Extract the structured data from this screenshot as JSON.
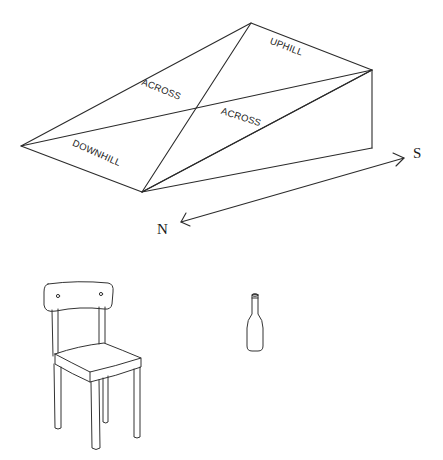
{
  "figure": {
    "type": "line-drawing"
  },
  "wedge": {
    "vertices": {
      "top": [
        251,
        23
      ],
      "right_top": [
        372,
        70
      ],
      "right_bottom": [
        372,
        148
      ],
      "bottom": [
        142,
        192
      ],
      "left": [
        21,
        146
      ]
    },
    "labels": {
      "uphill": "UPHILL",
      "across_upper": "ACROSS",
      "across_lower": "ACROSS",
      "downhill": "DOWNHILL"
    }
  },
  "compass": {
    "north_label": "N",
    "south_label": "S",
    "arrow_start": [
      181,
      222
    ],
    "arrow_end": [
      404,
      158
    ]
  },
  "objects": {
    "chair": "chair",
    "bottle": "bottle"
  },
  "colors": {
    "line": "#2b2b2b",
    "background": "#ffffff"
  }
}
